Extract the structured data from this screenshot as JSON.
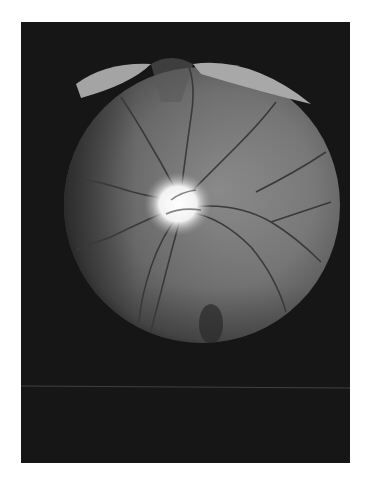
{
  "image": {
    "alt": "Grayscale fundus photograph of the retina showing optic disc and retinal blood vessels",
    "colors": {
      "background": "#ffffff",
      "frame": "#161616",
      "fundus": "#7a7a7a",
      "optic_disc": "#f4f4f4",
      "vessels": "#3a3a3a",
      "artifact": "#9a9a9a"
    }
  }
}
